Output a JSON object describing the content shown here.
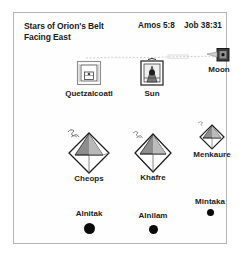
{
  "figure": {
    "title_lines": [
      "Stars of Orion's Belt",
      "Facing East"
    ],
    "references": {
      "amos": "Amos 5:8",
      "job": "Job 38:31"
    },
    "frame_color": "#b4b4b4",
    "ink_color": "#1b1b1b",
    "star_color": "#0a0a0a",
    "background": "#ffffff"
  },
  "celestial": [
    {
      "label": "Quetzalcoatl",
      "icon": "temple-square-icon"
    },
    {
      "label": "Sun",
      "icon": "sun-tablet-icon"
    },
    {
      "label": "Moon",
      "icon": "moon-tablet-icon"
    }
  ],
  "pyramids": [
    {
      "label": "Cheops",
      "icon": "pyramid-diamond-icon"
    },
    {
      "label": "Khafre",
      "icon": "pyramid-diamond-icon"
    },
    {
      "label": "Menkaure",
      "icon": "pyramid-diamond-icon"
    }
  ],
  "stars": [
    {
      "label": "Alnitak",
      "icon": "star-dot-icon"
    },
    {
      "label": "Alnilam",
      "icon": "star-dot-icon"
    },
    {
      "label": "Mintaka",
      "icon": "star-dot-icon"
    }
  ]
}
